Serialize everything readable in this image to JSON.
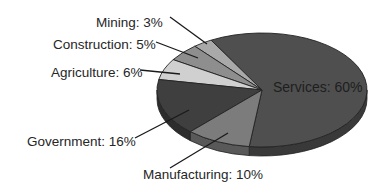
{
  "chart_data": {
    "type": "pie",
    "style": "3d",
    "title": "",
    "categories": [
      "Services",
      "Manufacturing",
      "Government",
      "Agriculture",
      "Construction",
      "Mining"
    ],
    "values": [
      60,
      10,
      16,
      6,
      5,
      3
    ],
    "unit": "%",
    "colors": {
      "Services": "#4f4f4f",
      "Manufacturing": "#7c7c7c",
      "Government": "#3f3f3f",
      "Agriculture": "#d0d0d0",
      "Construction": "#8e8e8e",
      "Mining": "#a9a9a9"
    },
    "labels": [
      {
        "name": "Services",
        "text": "Services: 60%"
      },
      {
        "name": "Manufacturing",
        "text": "Manufacturing: 10%"
      },
      {
        "name": "Government",
        "text": "Government: 16%"
      },
      {
        "name": "Agriculture",
        "text": "Agriculture: 6%"
      },
      {
        "name": "Construction",
        "text": "Construction: 5%"
      },
      {
        "name": "Mining",
        "text": "Mining: 3%"
      }
    ],
    "legend": "none"
  }
}
